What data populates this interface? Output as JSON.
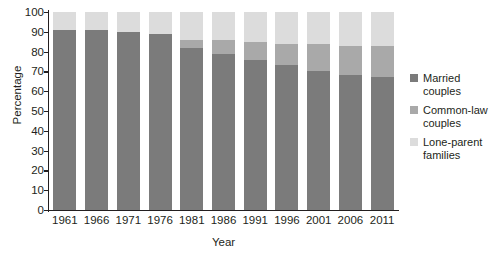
{
  "chart_data": {
    "type": "bar",
    "stacked": true,
    "title": "",
    "subtitle": "",
    "xlabel": "Year",
    "ylabel": "Percentage",
    "categories": [
      "1961",
      "1966",
      "1971",
      "1976",
      "1981",
      "1986",
      "1991",
      "1996",
      "2001",
      "2006",
      "2011"
    ],
    "ylim": [
      0,
      100
    ],
    "ytick_labels": [
      "0",
      "10",
      "20",
      "30",
      "40",
      "50",
      "60",
      "70",
      "80",
      "90",
      "100"
    ],
    "ytick_values": [
      0,
      10,
      20,
      30,
      40,
      50,
      60,
      70,
      80,
      90,
      100
    ],
    "grid": false,
    "legend_position": "right",
    "series": [
      {
        "name": "Married couples",
        "legend_label": "Married\ncouples",
        "color": "#7b7b7b",
        "values": [
          91,
          91,
          90,
          89,
          82,
          79,
          76,
          73,
          70,
          68,
          67
        ]
      },
      {
        "name": "Common-law couples",
        "legend_label": "Common-law\ncouples",
        "color": "#a9a9a9",
        "values": [
          0,
          0,
          0,
          0,
          4,
          7,
          9,
          11,
          14,
          15,
          16
        ]
      },
      {
        "name": "Lone-parent families",
        "legend_label": "Lone-parent\nfamilies",
        "color": "#dcdcdc",
        "values": [
          9,
          9,
          10,
          11,
          14,
          14,
          15,
          16,
          16,
          17,
          17
        ]
      }
    ]
  },
  "axis": {
    "y_title": "Percentage",
    "x_title": "Year"
  },
  "colors": {
    "married": "#7b7b7b",
    "common_law": "#a9a9a9",
    "lone_parent": "#dcdcdc",
    "axis": "#231f20",
    "background": "#ffffff"
  }
}
